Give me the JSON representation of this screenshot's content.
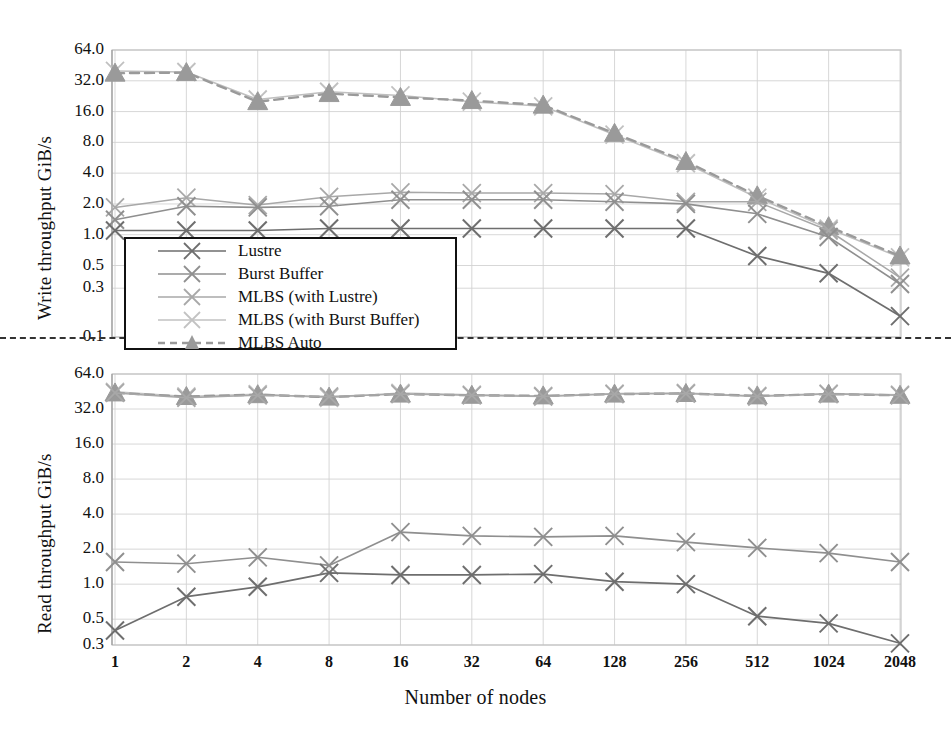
{
  "figure": {
    "xlabel": "Number of nodes",
    "background": "#ffffff"
  },
  "series_colors": {
    "lustre": "#6e6e6e",
    "burst_buffer": "#8f8f8f",
    "mlbs_lustre": "#a8a8a8",
    "mlbs_bb": "#c0c0c0",
    "mlbs_auto": "#9a9a9a"
  },
  "legend": {
    "items": [
      {
        "label": "Lustre",
        "color": "#6e6e6e",
        "marker": "x",
        "dash": false
      },
      {
        "label": "Burst Buffer",
        "color": "#8f8f8f",
        "marker": "x",
        "dash": false
      },
      {
        "label": "MLBS (with Lustre)",
        "color": "#a8a8a8",
        "marker": "x",
        "dash": false
      },
      {
        "label": "MLBS (with Burst Buffer)",
        "color": "#c2c2c2",
        "marker": "x",
        "dash": false
      },
      {
        "label": "MLBS Auto",
        "color": "#9a9a9a",
        "marker": "triangle",
        "dash": true
      }
    ]
  },
  "chart_data": [
    {
      "id": "write",
      "type": "line",
      "title": "",
      "xlabel": "Number of nodes",
      "ylabel": "Write throughput GiB/s",
      "xscale": "log2",
      "yscale": "log",
      "categories": [
        1,
        2,
        4,
        8,
        16,
        32,
        64,
        128,
        256,
        512,
        1024,
        2048
      ],
      "xticklabels": [
        "1",
        "2",
        "4",
        "8",
        "16",
        "32",
        "64",
        "128",
        "256",
        "512",
        "1024",
        "2048"
      ],
      "yticklabels": [
        "64.0",
        "32.0",
        "16.0",
        "8.0",
        "4.0",
        "2.0",
        "1.0",
        "0.5",
        "0.3",
        "0.1"
      ],
      "ytickvalues": [
        64.0,
        32.0,
        16.0,
        8.0,
        4.0,
        2.0,
        1.0,
        0.5,
        0.3,
        0.1
      ],
      "ylim": [
        0.1,
        64.0
      ],
      "grid": true,
      "legend_position": "inside-lower-left",
      "series": [
        {
          "name": "Lustre",
          "values": [
            1.1,
            1.1,
            1.1,
            1.15,
            1.15,
            1.15,
            1.15,
            1.15,
            1.15,
            0.62,
            0.42,
            0.16
          ]
        },
        {
          "name": "Burst Buffer",
          "values": [
            1.4,
            1.9,
            1.85,
            1.9,
            2.2,
            2.2,
            2.2,
            2.1,
            2.0,
            1.6,
            0.95,
            0.33
          ]
        },
        {
          "name": "MLBS (with Lustre)",
          "values": [
            1.85,
            2.3,
            1.95,
            2.35,
            2.6,
            2.55,
            2.55,
            2.5,
            2.1,
            2.1,
            1.1,
            0.38
          ]
        },
        {
          "name": "MLBS (with Burst Buffer)",
          "values": [
            40.0,
            39.0,
            21.0,
            25.0,
            23.0,
            20.0,
            18.0,
            9.5,
            5.0,
            2.3,
            1.15,
            0.6
          ]
        },
        {
          "name": "MLBS Auto",
          "values": [
            38.0,
            38.5,
            20.0,
            24.0,
            22.0,
            20.5,
            18.5,
            9.8,
            5.2,
            2.4,
            1.2,
            0.62
          ]
        }
      ]
    },
    {
      "id": "read",
      "type": "line",
      "title": "",
      "xlabel": "Number of nodes",
      "ylabel": "Read throughput GiB/s",
      "xscale": "log2",
      "yscale": "log",
      "categories": [
        1,
        2,
        4,
        8,
        16,
        32,
        64,
        128,
        256,
        512,
        1024,
        2048
      ],
      "xticklabels": [
        "1",
        "2",
        "4",
        "8",
        "16",
        "32",
        "64",
        "128",
        "256",
        "512",
        "1024",
        "2048"
      ],
      "yticklabels": [
        "64.0",
        "32.0",
        "16.0",
        "8.0",
        "4.0",
        "2.0",
        "1.0",
        "0.5",
        "0.3"
      ],
      "ytickvalues": [
        64.0,
        32.0,
        16.0,
        8.0,
        4.0,
        2.0,
        1.0,
        0.5,
        0.3
      ],
      "ylim": [
        0.3,
        64.0
      ],
      "grid": true,
      "legend_position": "shared-with-write-panel",
      "series": [
        {
          "name": "Lustre",
          "values": [
            0.4,
            0.78,
            0.95,
            1.25,
            1.2,
            1.2,
            1.22,
            1.05,
            1.0,
            0.53,
            0.46,
            0.31
          ]
        },
        {
          "name": "Burst Buffer",
          "values": [
            1.55,
            1.5,
            1.7,
            1.45,
            2.8,
            2.6,
            2.55,
            2.6,
            2.3,
            2.05,
            1.85,
            1.55
          ]
        },
        {
          "name": "MLBS (with Lustre)",
          "values": [
            44.0,
            40.0,
            42.0,
            41.0,
            43.0,
            42.0,
            41.0,
            43.0,
            43.5,
            41.0,
            43.0,
            42.0
          ]
        },
        {
          "name": "MLBS (with Burst Buffer)",
          "values": [
            45.0,
            41.0,
            43.0,
            40.0,
            44.0,
            42.5,
            41.5,
            43.5,
            44.0,
            41.5,
            43.5,
            42.5
          ]
        },
        {
          "name": "MLBS Auto",
          "values": [
            44.0,
            41.0,
            42.5,
            40.5,
            43.0,
            42.0,
            41.5,
            43.0,
            43.5,
            41.5,
            43.0,
            42.0
          ]
        }
      ]
    }
  ]
}
